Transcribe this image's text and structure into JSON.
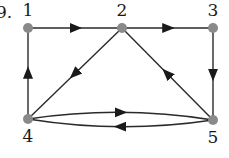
{
  "diagram": {
    "type": "directed-graph",
    "partial_label": "9.",
    "colors": {
      "edge": "#2a2a2a",
      "node": "#8a8a8a",
      "label": "#1a1a1a"
    },
    "nodes": [
      {
        "id": "1",
        "label": "1",
        "x": 28,
        "y": 28
      },
      {
        "id": "2",
        "label": "2",
        "x": 122,
        "y": 28
      },
      {
        "id": "3",
        "label": "3",
        "x": 213,
        "y": 28
      },
      {
        "id": "4",
        "label": "4",
        "x": 28,
        "y": 119
      },
      {
        "id": "5",
        "label": "5",
        "x": 213,
        "y": 120
      }
    ],
    "edges": [
      {
        "from": "1",
        "to": "2"
      },
      {
        "from": "2",
        "to": "3"
      },
      {
        "from": "3",
        "to": "5"
      },
      {
        "from": "5",
        "to": "2"
      },
      {
        "from": "2",
        "to": "4"
      },
      {
        "from": "4",
        "to": "1"
      },
      {
        "from": "4",
        "to": "5",
        "curve": "upper"
      },
      {
        "from": "5",
        "to": "4",
        "curve": "lower"
      }
    ]
  }
}
